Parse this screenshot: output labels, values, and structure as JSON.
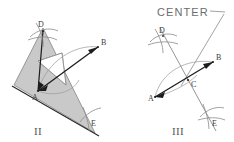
{
  "canvas": {
    "width": 234,
    "height": 142,
    "background": "#ffffff"
  },
  "palette": {
    "triangle_fill": "#c9c9c9",
    "triangle_stroke": "#8f8f8f",
    "chord_line": "#1c1c1c",
    "construction_line": "#8a8a8a",
    "arc_line": "#909090",
    "label_text": "#3b3b3b",
    "numeral_text": "#555555",
    "center_text": "#6d6d6d"
  },
  "annotation": {
    "center_callout": "CENTER"
  },
  "figures": [
    {
      "id": "figure-two",
      "numeral": "II",
      "description": "Drafting triangle placed with its right-angle corner on the circle; chords A-B and A-D drawn along the legs",
      "points": [
        {
          "name": "A",
          "label": "A",
          "x": 38,
          "y": 91
        },
        {
          "name": "B",
          "label": "B",
          "x": 98,
          "y": 47
        },
        {
          "name": "D",
          "label": "D",
          "x": 43,
          "y": 31
        },
        {
          "name": "E",
          "label": "E",
          "x": 91,
          "y": 119
        }
      ]
    },
    {
      "id": "figure-three",
      "numeral": "III",
      "description": "Chords A-B and D-E drawn; their intersection C marks the center of the circle",
      "points": [
        {
          "name": "A",
          "label": "A",
          "x": 155,
          "y": 97
        },
        {
          "name": "B",
          "label": "B",
          "x": 213,
          "y": 62
        },
        {
          "name": "C",
          "label": "C",
          "x": 190,
          "y": 79
        },
        {
          "name": "D",
          "label": "D",
          "x": 163,
          "y": 36
        },
        {
          "name": "E",
          "label": "E",
          "x": 212,
          "y": 122
        }
      ]
    }
  ]
}
